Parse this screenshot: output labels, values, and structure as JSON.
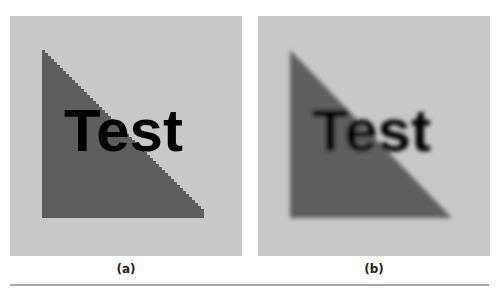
{
  "figure": {
    "panels": [
      {
        "id": "a",
        "caption": "(a)",
        "text": "Test",
        "rendering": "aliased"
      },
      {
        "id": "b",
        "caption": "(b)",
        "text": "Test",
        "rendering": "blurred"
      }
    ],
    "colors": {
      "background": "#c8c8c8",
      "triangle": "#5e5e5e",
      "text": "#000000",
      "divider": "#a8a8a8"
    }
  }
}
